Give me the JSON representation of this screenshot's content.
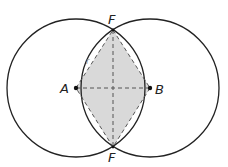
{
  "diagram": {
    "colors": {
      "stroke": "#222222",
      "fill": "#d9d9d9",
      "dash": "#555555",
      "background": "#ffffff"
    },
    "circles": [
      {
        "name": "circle-A",
        "cx": 76,
        "cy": 88,
        "r": 69
      },
      {
        "name": "circle-B",
        "cx": 150,
        "cy": 88,
        "r": 69
      }
    ],
    "points": {
      "A": {
        "label": "A",
        "x": 76,
        "y": 88
      },
      "B": {
        "label": "B",
        "x": 150,
        "y": 88
      },
      "F_top": {
        "label": "F",
        "x": 113,
        "y": 30
      },
      "F_bottom": {
        "label": "F",
        "x": 113,
        "y": 147
      }
    },
    "labels": {
      "a": "A",
      "b": "B",
      "f_top": "F",
      "f_bottom": "F",
      "r": "r"
    }
  }
}
